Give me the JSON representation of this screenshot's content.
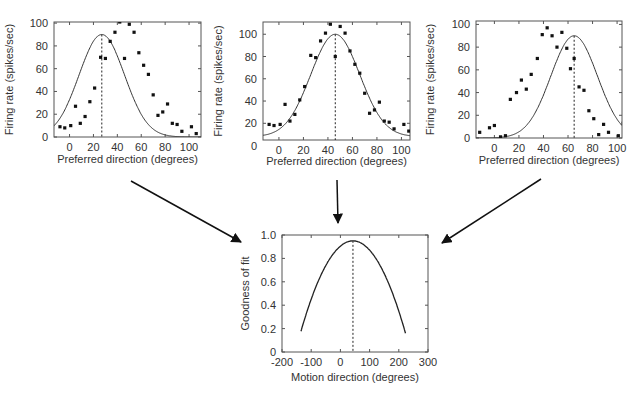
{
  "chart_data": [
    {
      "type": "scatter",
      "id": "panel-left",
      "title": "",
      "xlabel": "Preferred direction (degrees)",
      "ylabel": "Firing rate (spikes/sec)",
      "xlim": [
        -13,
        110
      ],
      "ylim": [
        0,
        101
      ],
      "xticks": [
        0,
        20,
        40,
        60,
        80,
        100
      ],
      "yticks": [
        0,
        20,
        40,
        60,
        80,
        100
      ],
      "dashed_line_x": 27,
      "fit_curve": {
        "type": "gaussian",
        "peak_x": 27,
        "peak_y": 90,
        "sigma": 19,
        "baseline": 0
      },
      "points": [
        [
          -8,
          9
        ],
        [
          -4,
          8
        ],
        [
          1,
          10
        ],
        [
          5,
          27
        ],
        [
          9,
          12
        ],
        [
          13,
          18
        ],
        [
          17,
          31
        ],
        [
          21,
          43
        ],
        [
          26,
          70
        ],
        [
          30,
          69
        ],
        [
          34,
          84
        ],
        [
          38,
          92
        ],
        [
          42,
          101
        ],
        [
          46,
          69
        ],
        [
          50,
          99
        ],
        [
          54,
          92
        ],
        [
          58,
          74
        ],
        [
          62,
          63
        ],
        [
          66,
          55
        ],
        [
          70,
          37
        ],
        [
          74,
          19
        ],
        [
          78,
          22
        ],
        [
          82,
          29
        ],
        [
          86,
          12
        ],
        [
          90,
          11
        ],
        [
          94,
          5
        ],
        [
          102,
          9
        ],
        [
          106,
          3
        ]
      ]
    },
    {
      "type": "scatter",
      "id": "panel-middle",
      "title": "",
      "xlabel": "Preferred direction (degrees)",
      "ylabel": "Firing rate (spikes/sec)",
      "xlim": [
        -13,
        107
      ],
      "ylim": [
        5,
        111
      ],
      "xticks": [
        0,
        20,
        40,
        60,
        80,
        100
      ],
      "yticks": [
        0,
        20,
        40,
        60,
        80,
        100
      ],
      "dashed_line_x": 46,
      "fit_curve": {
        "type": "gaussian",
        "peak_x": 46,
        "peak_y": 100,
        "sigma": 20,
        "baseline": 8
      },
      "points": [
        [
          -8,
          19
        ],
        [
          -4,
          18
        ],
        [
          1,
          19
        ],
        [
          5,
          37
        ],
        [
          9,
          22
        ],
        [
          13,
          28
        ],
        [
          17,
          41
        ],
        [
          21,
          53
        ],
        [
          26,
          81
        ],
        [
          30,
          79
        ],
        [
          34,
          94
        ],
        [
          38,
          101
        ],
        [
          42,
          109
        ],
        [
          46,
          80
        ],
        [
          50,
          107
        ],
        [
          54,
          101
        ],
        [
          58,
          85
        ],
        [
          62,
          73
        ],
        [
          66,
          65
        ],
        [
          70,
          47
        ],
        [
          74,
          29
        ],
        [
          78,
          32
        ],
        [
          82,
          39
        ],
        [
          86,
          22
        ],
        [
          90,
          21
        ],
        [
          94,
          15
        ],
        [
          102,
          19
        ],
        [
          106,
          13
        ]
      ]
    },
    {
      "type": "scatter",
      "id": "panel-right",
      "title": "",
      "xlabel": "Preferred direction (degrees)",
      "ylabel": "Firing rate (spikes/sec)",
      "xlim": [
        -15,
        104
      ],
      "ylim": [
        0,
        103
      ],
      "xticks": [
        0,
        20,
        40,
        60,
        80,
        100
      ],
      "yticks": [
        0,
        20,
        40,
        60,
        80,
        100
      ],
      "dashed_line_x": 65,
      "fit_curve": {
        "type": "gaussian",
        "peak_x": 65,
        "peak_y": 90,
        "sigma": 19,
        "baseline": 0
      },
      "points": [
        [
          -12,
          5
        ],
        [
          -4,
          9
        ],
        [
          0,
          11
        ],
        [
          5,
          1
        ],
        [
          9,
          2
        ],
        [
          13,
          34
        ],
        [
          18,
          40
        ],
        [
          22,
          51
        ],
        [
          26,
          43
        ],
        [
          30,
          56
        ],
        [
          35,
          70
        ],
        [
          39,
          91
        ],
        [
          43,
          97
        ],
        [
          47,
          90
        ],
        [
          51,
          80
        ],
        [
          55,
          93
        ],
        [
          59,
          79
        ],
        [
          62,
          61
        ],
        [
          65,
          70
        ],
        [
          69,
          45
        ],
        [
          73,
          42
        ],
        [
          77,
          24
        ],
        [
          81,
          17
        ],
        [
          85,
          3
        ],
        [
          89,
          12
        ],
        [
          93,
          5
        ],
        [
          101,
          2
        ],
        [
          105,
          13
        ]
      ]
    },
    {
      "type": "line",
      "id": "panel-bottom",
      "title": "",
      "xlabel": "Motion direction (degrees)",
      "ylabel": "Goodness of fit",
      "xlim": [
        -200,
        300
      ],
      "ylim": [
        0,
        1.0
      ],
      "xticks": [
        -200,
        -100,
        0,
        100,
        200,
        300
      ],
      "yticks": [
        0,
        0.2,
        0.4,
        0.6,
        0.8,
        1.0
      ],
      "dashed_line_x": 43,
      "curve": {
        "type": "parabola",
        "peak_x": 43,
        "peak_y": 0.95,
        "x_start": -135,
        "x_end": 223,
        "end_y": 0.16
      }
    }
  ],
  "tick_labels": {
    "panel_x": [
      "0",
      "20",
      "40",
      "60",
      "80",
      "100"
    ],
    "panel_y": [
      "0",
      "20",
      "40",
      "60",
      "80",
      "100"
    ],
    "bottom_x": [
      "-200",
      "-100",
      "0",
      "100",
      "200",
      "300"
    ],
    "bottom_y": [
      "0",
      "0.2",
      "0.4",
      "0.6",
      "0.8",
      "1.0"
    ]
  },
  "labels": {
    "preferred_direction": "Preferred direction (degrees)",
    "firing_rate": "Firing rate (spikes/sec)",
    "motion_direction": "Motion direction (degrees)",
    "goodness_of_fit": "Goodness of fit"
  },
  "arrows": [
    {
      "from": "panel-left",
      "to": "panel-bottom"
    },
    {
      "from": "panel-middle",
      "to": "panel-bottom"
    },
    {
      "from": "panel-right",
      "to": "panel-bottom"
    }
  ]
}
